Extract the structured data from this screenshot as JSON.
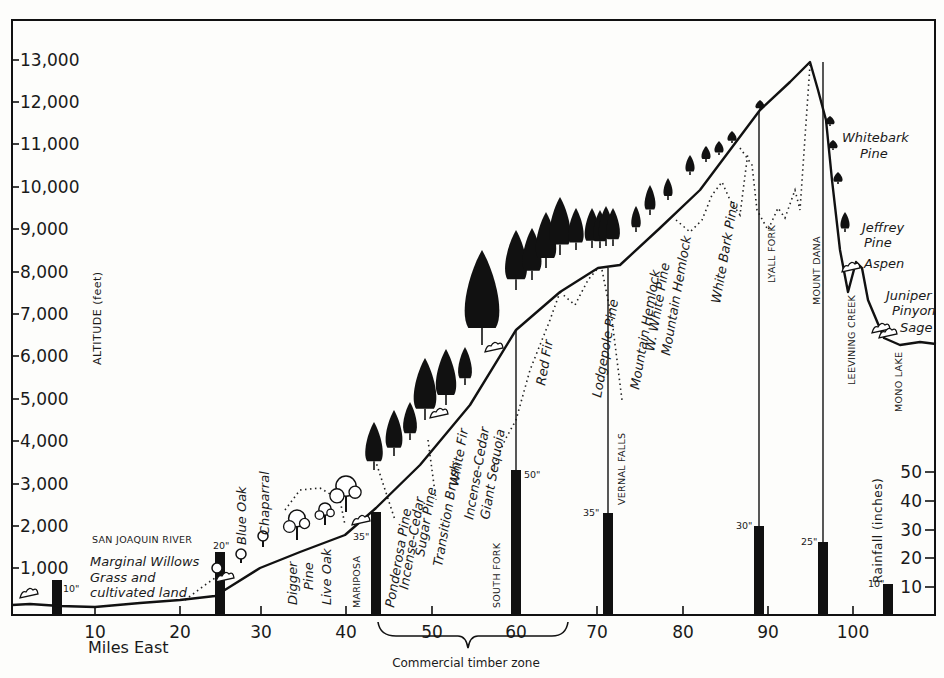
{
  "chart_data": {
    "type": "diagram",
    "xlabel": "Miles East",
    "ylabel_left": "ALTITUDE (feet)",
    "ylabel_right": "Rainfall (inches)",
    "x_ticks": [
      10,
      20,
      30,
      40,
      50,
      60,
      70,
      80,
      90,
      100
    ],
    "y_ticks_altitude": [
      "1,000",
      "2,000",
      "3,000",
      "4,000",
      "5,000",
      "6,000",
      "7,000",
      "8,000",
      "9,000",
      "10,000",
      "11,000",
      "12,000",
      "13,000"
    ],
    "y_ticks_rainfall": [
      "10",
      "20",
      "30",
      "40",
      "50"
    ],
    "xlim": [
      0,
      110
    ],
    "ylim_altitude": [
      0,
      13500
    ],
    "ylim_rainfall": [
      0,
      55
    ],
    "profile_pixels": [
      [
        12,
        605
      ],
      [
        30,
        604
      ],
      [
        60,
        606
      ],
      [
        95,
        607
      ],
      [
        140,
        603
      ],
      [
        180,
        600
      ],
      [
        215,
        596
      ],
      [
        228,
        588
      ],
      [
        260,
        568
      ],
      [
        300,
        552
      ],
      [
        345,
        535
      ],
      [
        376,
        508
      ],
      [
        420,
        465
      ],
      [
        470,
        405
      ],
      [
        516,
        330
      ],
      [
        560,
        292
      ],
      [
        598,
        268
      ],
      [
        620,
        265
      ],
      [
        660,
        228
      ],
      [
        700,
        190
      ],
      [
        760,
        110
      ],
      [
        790,
        82
      ],
      [
        810,
        62
      ],
      [
        818,
        90
      ],
      [
        826,
        120
      ],
      [
        832,
        180
      ],
      [
        840,
        250
      ],
      [
        848,
        292
      ],
      [
        856,
        262
      ],
      [
        862,
        268
      ],
      [
        868,
        300
      ],
      [
        884,
        338
      ],
      [
        900,
        345
      ],
      [
        920,
        342
      ],
      [
        936,
        344
      ]
    ],
    "rainfall_stations": [
      {
        "mile": 5,
        "inches": 10,
        "label": "10\"",
        "place": ""
      },
      {
        "mile": 25,
        "inches": 20,
        "label": "20\"",
        "place": "SAN JOAQUIN RIVER"
      },
      {
        "mile": 43.5,
        "inches": 35,
        "label": "35\"",
        "place": "MARIPOSA"
      },
      {
        "mile": 60,
        "inches": 50,
        "label": "50\"",
        "place": "SOUTH FORK"
      },
      {
        "mile": 71.5,
        "inches": 35,
        "label": "35\"",
        "place": "VERNAL FALLS"
      },
      {
        "mile": 89,
        "inches": 30,
        "label": "30\"",
        "place": "LYALL FORK"
      },
      {
        "mile": 96.5,
        "inches": 25,
        "label": "25\"",
        "place": "MOUNT DANA"
      },
      {
        "mile": 104,
        "inches": 10,
        "label": "10\"",
        "place": "MONO LAKE"
      }
    ],
    "vegetation_zones": [
      "Grass and cultivated land",
      "Marginal Willows",
      "Blue Oak",
      "Chaparral",
      "Digger Pine",
      "Live Oak",
      "Ponderosa Pine",
      "Incense-Cedar",
      "Sugar Pine",
      "Transition Brush",
      "White Fir",
      "Incense-Cedar",
      "Giant Sequoia",
      "Red Fir",
      "Lodgepole Pine",
      "Mountain Hemlock",
      "W. White Pine",
      "Mountain Hemlock",
      "White Bark Pine",
      "Whitebark Pine",
      "Jeffrey Pine",
      "Aspen",
      "Juniper",
      "Pinyon",
      "Sage"
    ],
    "annotations": [
      "Commercial timber zone (miles ~44 to ~65)",
      "LEEVINING CREEK"
    ],
    "grid": false,
    "legend": "none"
  },
  "axes": {
    "xlabel": "Miles East",
    "ylabel_left": "ALTITUDE  (feet)",
    "ylabel_right": "Rainfall (inches)",
    "x_ticks": [
      {
        "label": "10",
        "x": 95
      },
      {
        "label": "20",
        "x": 180
      },
      {
        "label": "30",
        "x": 261
      },
      {
        "label": "40",
        "x": 346
      },
      {
        "label": "50",
        "x": 432
      },
      {
        "label": "60",
        "x": 516
      },
      {
        "label": "70",
        "x": 597
      },
      {
        "label": "80",
        "x": 683
      },
      {
        "label": "90",
        "x": 768
      },
      {
        "label": "100",
        "x": 853
      }
    ],
    "alt_ticks": [
      {
        "label": "1,000",
        "y": 568
      },
      {
        "label": "2,000",
        "y": 526
      },
      {
        "label": "3,000",
        "y": 484
      },
      {
        "label": "4,000",
        "y": 441
      },
      {
        "label": "5,000",
        "y": 399
      },
      {
        "label": "6,000",
        "y": 356
      },
      {
        "label": "7,000",
        "y": 314
      },
      {
        "label": "8,000",
        "y": 272
      },
      {
        "label": "9,000",
        "y": 229
      },
      {
        "label": "10,000",
        "y": 187
      },
      {
        "label": "11,000",
        "y": 144
      },
      {
        "label": "12,000",
        "y": 102
      },
      {
        "label": "13,000",
        "y": 60
      }
    ],
    "rain_ticks": [
      {
        "label": "50",
        "y": 472
      },
      {
        "label": "40",
        "y": 501
      },
      {
        "label": "30",
        "y": 530
      },
      {
        "label": "20",
        "y": 558
      },
      {
        "label": "10",
        "y": 587
      }
    ]
  },
  "bars": [
    {
      "x": 57,
      "top": 580,
      "label": "10\"",
      "lx": 63,
      "ly": 592,
      "align": "start",
      "line_top": null
    },
    {
      "x": 220,
      "top": 552,
      "label": "20\"",
      "lx": 213,
      "ly": 549,
      "align": "start",
      "line_top": null
    },
    {
      "x": 376,
      "top": 512,
      "label": "35\"",
      "lx": 353,
      "ly": 540,
      "align": "start",
      "line_top": null
    },
    {
      "x": 516,
      "top": 470,
      "label": "50\"",
      "lx": 524,
      "ly": 478,
      "align": "start",
      "line_top": 330
    },
    {
      "x": 608,
      "top": 513,
      "label": "35\"",
      "lx": 583,
      "ly": 516,
      "align": "start",
      "line_top": 268
    },
    {
      "x": 759,
      "top": 526,
      "label": "30\"",
      "lx": 736,
      "ly": 529,
      "align": "start",
      "line_top": 112
    },
    {
      "x": 823,
      "top": 542,
      "label": "25\"",
      "lx": 801,
      "ly": 545,
      "align": "start",
      "line_top": 62
    },
    {
      "x": 888,
      "top": 584,
      "label": "10\"",
      "lx": 868,
      "ly": 587,
      "align": "start",
      "line_top": null
    }
  ],
  "places": [
    {
      "text": "SAN JOAQUIN RIVER",
      "x": 92,
      "y": 543,
      "rot": 0
    },
    {
      "text": "MARIPOSA",
      "x": 360,
      "y": 608,
      "rot": -90
    },
    {
      "text": "SOUTH FORK",
      "x": 500,
      "y": 608,
      "rot": -90
    },
    {
      "text": "VERNAL FALLS",
      "x": 625,
      "y": 505,
      "rot": -90
    },
    {
      "text": "LYALL FORK",
      "x": 775,
      "y": 283,
      "rot": -90
    },
    {
      "text": "MOUNT DANA",
      "x": 820,
      "y": 305,
      "rot": -90
    },
    {
      "text": "LEEVINING CREEK",
      "x": 855,
      "y": 385,
      "rot": -90
    },
    {
      "text": "MONO LAKE",
      "x": 902,
      "y": 412,
      "rot": -90
    }
  ],
  "veg_labels": [
    {
      "text": "Marginal Willows",
      "x": 90,
      "y": 566,
      "rot": 0
    },
    {
      "text": "Grass and",
      "x": 90,
      "y": 582,
      "rot": 0
    },
    {
      "text": "cultivated land",
      "x": 90,
      "y": 597,
      "rot": 0
    },
    {
      "text": "Blue Oak",
      "x": 246,
      "y": 545,
      "rot": -90
    },
    {
      "text": "Chaparral",
      "x": 269,
      "y": 535,
      "rot": -90
    },
    {
      "text": "Digger",
      "x": 297,
      "y": 605,
      "rot": -90
    },
    {
      "text": "Pine",
      "x": 313,
      "y": 590,
      "rot": -90
    },
    {
      "text": "Live Oak",
      "x": 331,
      "y": 605,
      "rot": -90
    },
    {
      "text": "Ponderosa Pine",
      "x": 394,
      "y": 608,
      "rot": -80
    },
    {
      "text": "Incense-Cedar",
      "x": 408,
      "y": 590,
      "rot": -80
    },
    {
      "text": "Sugar Pine",
      "x": 424,
      "y": 557,
      "rot": -80
    },
    {
      "text": "Transition Brush",
      "x": 442,
      "y": 567,
      "rot": -80
    },
    {
      "text": "White Fir",
      "x": 458,
      "y": 487,
      "rot": -80
    },
    {
      "text": "Incense-Cedar",
      "x": 473,
      "y": 520,
      "rot": -80
    },
    {
      "text": "Giant Sequoia",
      "x": 489,
      "y": 520,
      "rot": -80
    },
    {
      "text": "Red Fir",
      "x": 545,
      "y": 386,
      "rot": -80
    },
    {
      "text": "Lodgepole Pine",
      "x": 601,
      "y": 398,
      "rot": -80
    },
    {
      "text": "Mountain Hemlock",
      "x": 639,
      "y": 390,
      "rot": -80
    },
    {
      "text": "W. White Pine",
      "x": 654,
      "y": 352,
      "rot": -80
    },
    {
      "text": "Mountain Hemlock",
      "x": 670,
      "y": 356,
      "rot": -80
    },
    {
      "text": "White Bark Pine",
      "x": 720,
      "y": 304,
      "rot": -80
    },
    {
      "text": "Whitebark",
      "x": 842,
      "y": 142,
      "rot": 0
    },
    {
      "text": "Pine",
      "x": 860,
      "y": 158,
      "rot": 0
    },
    {
      "text": "Jeffrey",
      "x": 862,
      "y": 232,
      "rot": 0
    },
    {
      "text": "Pine",
      "x": 864,
      "y": 247,
      "rot": 0
    },
    {
      "text": "Aspen",
      "x": 864,
      "y": 268,
      "rot": 0
    },
    {
      "text": "Juniper",
      "x": 886,
      "y": 300,
      "rot": 0
    },
    {
      "text": "Pinyon",
      "x": 892,
      "y": 315,
      "rot": 0
    },
    {
      "text": "Sage",
      "x": 900,
      "y": 332,
      "rot": 0
    }
  ],
  "annotation": {
    "text": "Commercial timber zone",
    "x": 466,
    "y": 667
  },
  "colors": {
    "ink": "#111111",
    "paper": "#fdfdfb"
  },
  "icons": {
    "conifer": "conifer-tree-icon",
    "oak": "oak-tree-icon",
    "shrub": "shrub-icon"
  },
  "trees": {
    "conifers": [
      [
        374,
        470,
        48
      ],
      [
        394,
        456,
        46
      ],
      [
        410,
        440,
        38
      ],
      [
        425,
        420,
        62
      ],
      [
        446,
        405,
        56
      ],
      [
        465,
        385,
        38
      ],
      [
        482,
        345,
        95
      ],
      [
        516,
        290,
        60
      ],
      [
        532,
        280,
        52
      ],
      [
        546,
        268,
        56
      ],
      [
        560,
        255,
        58
      ],
      [
        576,
        250,
        42
      ],
      [
        592,
        248,
        40
      ],
      [
        600,
        248,
        38
      ],
      [
        606,
        246,
        40
      ],
      [
        613,
        246,
        38
      ],
      [
        636,
        232,
        26
      ],
      [
        650,
        215,
        30
      ],
      [
        668,
        200,
        22
      ],
      [
        690,
        175,
        20
      ],
      [
        706,
        162,
        16
      ],
      [
        719,
        155,
        14
      ],
      [
        732,
        143,
        12
      ],
      [
        760,
        110,
        10
      ],
      [
        830,
        126,
        10
      ],
      [
        833,
        150,
        10
      ],
      [
        838,
        184,
        12
      ],
      [
        845,
        232,
        20
      ]
    ],
    "oaks": [
      [
        217,
        577,
        14
      ],
      [
        241,
        563,
        14
      ],
      [
        263,
        547,
        16
      ],
      [
        297,
        540,
        30
      ],
      [
        325,
        525,
        22
      ],
      [
        346,
        512,
        36
      ]
    ],
    "shrubs": [
      [
        28,
        598
      ],
      [
        224,
        582
      ],
      [
        360,
        525
      ],
      [
        438,
        418
      ],
      [
        493,
        352
      ],
      [
        850,
        272
      ],
      [
        880,
        333
      ],
      [
        887,
        338
      ]
    ]
  }
}
